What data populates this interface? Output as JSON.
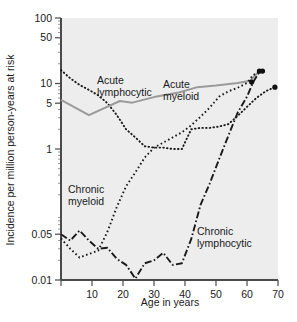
{
  "chart_data": {
    "type": "line",
    "title": "",
    "subtitle": "",
    "xlabel": "Age in years",
    "ylabel": "Incidence per million person-years at risk",
    "yscale": "log",
    "xlim": [
      0,
      70
    ],
    "ylim": [
      0.01,
      100
    ],
    "grid": false,
    "legend_position": "inline-annotations",
    "background": "#ededed",
    "xticks": [
      0,
      10,
      20,
      30,
      40,
      50,
      60,
      70
    ],
    "xtick_labels": [
      "",
      "10",
      "20",
      "30",
      "40",
      "50",
      "60",
      "70"
    ],
    "yticks": [
      0.01,
      0.05,
      1,
      5,
      10,
      50,
      100
    ],
    "ytick_labels": [
      "0.01",
      "0.05",
      "1",
      "5",
      "10",
      "50",
      "100"
    ],
    "series": [
      {
        "name": "Acute lymphocytic",
        "style": "dotted",
        "color": "#1a1a1a",
        "label_x": 97,
        "label_y": 84,
        "points": [
          [
            0,
            16.0
          ],
          [
            3,
            12.0
          ],
          [
            6,
            9.5
          ],
          [
            9,
            8.0
          ],
          [
            12,
            6.6
          ],
          [
            15,
            5.0
          ],
          [
            18,
            3.3
          ],
          [
            21,
            2.0
          ],
          [
            24,
            1.5
          ],
          [
            27,
            1.1
          ],
          [
            30,
            1.05
          ],
          [
            33,
            1.05
          ],
          [
            36,
            1.0
          ],
          [
            39,
            1.0
          ],
          [
            42,
            2.0
          ],
          [
            45,
            2.1
          ],
          [
            48,
            2.1
          ],
          [
            51,
            2.2
          ],
          [
            54,
            2.4
          ],
          [
            57,
            3.2
          ],
          [
            60,
            4.4
          ],
          [
            63,
            6.0
          ],
          [
            66,
            7.6
          ],
          [
            69,
            8.8
          ]
        ]
      },
      {
        "name": "Acute myeloid",
        "style": "solid",
        "color": "#9a9a9a",
        "label_x": 163,
        "label_y": 88,
        "points": [
          [
            0,
            5.6
          ],
          [
            9,
            3.3
          ],
          [
            19,
            5.4
          ],
          [
            23,
            5.1
          ],
          [
            30,
            6.2
          ],
          [
            38,
            7.3
          ],
          [
            44,
            8.8
          ],
          [
            50,
            9.3
          ],
          [
            57,
            10.2
          ],
          [
            61,
            11.0
          ],
          [
            64,
            15.5
          ]
        ]
      },
      {
        "name": "Chronic myeloid",
        "style": "dashed",
        "color": "#1a1a1a",
        "label_x": 68,
        "label_y": 193,
        "points": [
          [
            0,
            0.043
          ],
          [
            3,
            0.03
          ],
          [
            6,
            0.022
          ],
          [
            9,
            0.025
          ],
          [
            12,
            0.028
          ],
          [
            15,
            0.055
          ],
          [
            18,
            0.13
          ],
          [
            21,
            0.27
          ],
          [
            24,
            0.44
          ],
          [
            27,
            0.74
          ],
          [
            30,
            1.05
          ],
          [
            33,
            1.25
          ],
          [
            36,
            1.5
          ],
          [
            39,
            1.8
          ],
          [
            42,
            2.3
          ],
          [
            45,
            3.1
          ],
          [
            48,
            4.3
          ],
          [
            51,
            6.3
          ],
          [
            54,
            7.6
          ],
          [
            57,
            8.6
          ],
          [
            60,
            10.2
          ],
          [
            62,
            13.5
          ],
          [
            65,
            15.5
          ]
        ]
      },
      {
        "name": "Chronic lymphocytic",
        "style": "dashdot",
        "color": "#1a1a1a",
        "label_x": 197,
        "label_y": 235,
        "points": [
          [
            0,
            0.05
          ],
          [
            3,
            0.04
          ],
          [
            6,
            0.057
          ],
          [
            9,
            0.04
          ],
          [
            12,
            0.03
          ],
          [
            15,
            0.031
          ],
          [
            18,
            0.021
          ],
          [
            21,
            0.017
          ],
          [
            24,
            0.0105
          ],
          [
            27,
            0.018
          ],
          [
            30,
            0.02
          ],
          [
            33,
            0.026
          ],
          [
            36,
            0.017
          ],
          [
            39,
            0.018
          ],
          [
            42,
            0.042
          ],
          [
            45,
            0.14
          ],
          [
            48,
            0.3
          ],
          [
            51,
            0.7
          ],
          [
            54,
            1.6
          ],
          [
            57,
            3.6
          ],
          [
            60,
            6.3
          ],
          [
            62,
            10.5
          ],
          [
            64,
            15.0
          ]
        ]
      }
    ],
    "endpoint_markers": [
      {
        "series": "Acute myeloid",
        "x": 64,
        "y": 15.5
      },
      {
        "series": "Chronic myeloid",
        "x": 65,
        "y": 15.5
      },
      {
        "series": "Chronic lymphocytic",
        "x": 61.5,
        "y": 10.5
      },
      {
        "series": "Acute lymphocytic",
        "x": 69,
        "y": 8.8
      }
    ],
    "annotations": [
      {
        "text_line1": "Acute",
        "text_line2": "lymphocytic"
      },
      {
        "text_line1": "Acute",
        "text_line2": "myeloid"
      },
      {
        "text_line1": "Chronic",
        "text_line2": "myeloid"
      },
      {
        "text_line1": "Chronic",
        "text_line2": "lymphocytic"
      }
    ]
  }
}
